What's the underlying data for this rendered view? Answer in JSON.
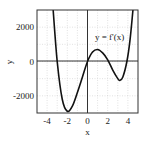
{
  "chart_data": {
    "type": "line",
    "title": "",
    "xlabel": "x",
    "ylabel": "y",
    "xlim": [
      -5,
      5
    ],
    "ylim": [
      -3000,
      3000
    ],
    "grid": true,
    "x_ticks": [
      -4,
      -2,
      0,
      2,
      4
    ],
    "x_tick_labels": [
      "-4",
      "-2",
      "0",
      "2",
      "4"
    ],
    "y_ticks": [
      -2000,
      0,
      2000
    ],
    "y_tick_labels": [
      "-2000",
      "0",
      "2000"
    ],
    "annotation": "y = f'(x)",
    "series": [
      {
        "name": "y = f'(x)",
        "x": [
          -3.4,
          -3.0,
          -2.5,
          -2.0,
          -1.5,
          -1.0,
          -0.5,
          0.0,
          0.5,
          1.0,
          1.5,
          2.0,
          2.5,
          3.0,
          3.2,
          3.5,
          3.9,
          4.2,
          4.5
        ],
        "y": [
          3000,
          0,
          -2200,
          -2900,
          -2600,
          -1800,
          -900,
          0,
          550,
          700,
          500,
          100,
          -500,
          -1000,
          -1100,
          -900,
          0,
          1200,
          3000
        ]
      }
    ]
  }
}
